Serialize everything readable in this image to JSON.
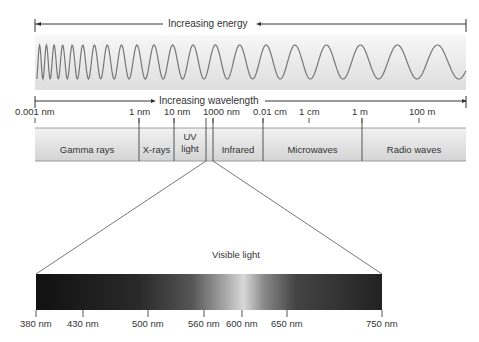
{
  "energy_axis": {
    "label": "Increasing energy"
  },
  "wavelength_axis": {
    "label": "Increasing wavelength",
    "ticks": [
      {
        "label": "0.001 nm",
        "x": 35
      },
      {
        "label": "1 nm",
        "x": 139
      },
      {
        "label": "10 nm",
        "x": 174
      },
      {
        "label": "1000 nm",
        "x": 213
      },
      {
        "label": "0.01 cm",
        "x": 263
      },
      {
        "label": "1 cm",
        "x": 309
      },
      {
        "label": "1 m",
        "x": 362
      },
      {
        "label": "100 m",
        "x": 419
      }
    ]
  },
  "bands": [
    {
      "label": "Gamma rays",
      "x0": 35,
      "x1": 139
    },
    {
      "label": "X-rays",
      "x0": 139,
      "x1": 174
    },
    {
      "label": "UV light",
      "line1": "UV",
      "line2": "light",
      "x0": 174,
      "x1": 206
    },
    {
      "label": "Infrared",
      "x0": 213,
      "x1": 263
    },
    {
      "label": "Microwaves",
      "x0": 263,
      "x1": 362
    },
    {
      "label": "Radio waves",
      "x0": 362,
      "x1": 466
    }
  ],
  "visible": {
    "title": "Visible light",
    "ticks": [
      {
        "label": "380 nm",
        "x": 36
      },
      {
        "label": "430 nm",
        "x": 83
      },
      {
        "label": "500 nm",
        "x": 148
      },
      {
        "label": "560 nm",
        "x": 204
      },
      {
        "label": "600 nm",
        "x": 242
      },
      {
        "label": "650 nm",
        "x": 287
      },
      {
        "label": "750 nm",
        "x": 382
      }
    ]
  }
}
